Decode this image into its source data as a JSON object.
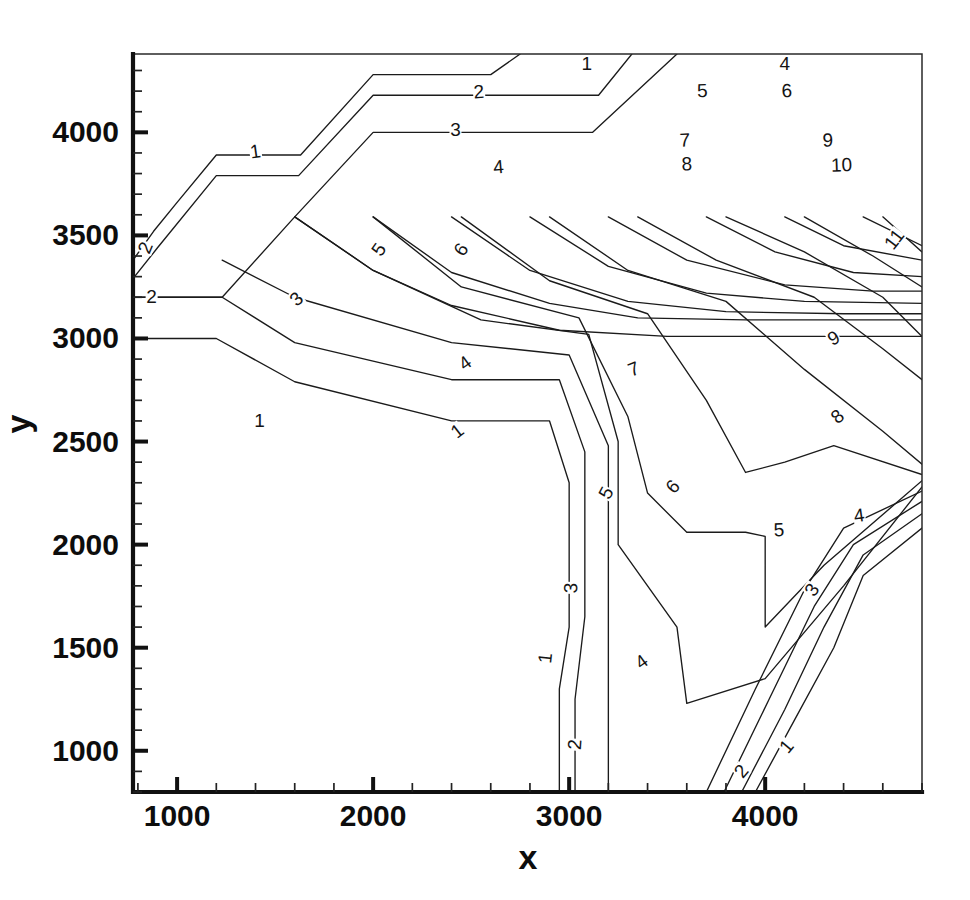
{
  "chart_data": {
    "type": "line",
    "title": "",
    "subtitle": "",
    "xlabel": "x",
    "ylabel": "y",
    "xlim": [
      775,
      4800
    ],
    "ylim": [
      800,
      4380
    ],
    "grid": false,
    "legend": "none",
    "plot_style": "contour",
    "contour_interval": 1,
    "contour_levels": [
      1,
      2,
      3,
      4,
      5,
      6,
      7,
      8,
      9,
      10,
      11
    ],
    "x_ticks_major": [
      1000,
      2000,
      3000,
      4000
    ],
    "x_ticks_major_labels": [
      "1000",
      "2000",
      "3000",
      "4000"
    ],
    "x_minor_per_major": 5,
    "y_ticks_major": [
      1000,
      1500,
      2000,
      2500,
      3000,
      3500,
      4000
    ],
    "y_ticks_major_labels": [
      "1000",
      "1500",
      "2000",
      "2500",
      "3000",
      "3500",
      "4000"
    ],
    "y_minor_per_major": 5,
    "line_color": "#1b1b1b",
    "axis_color": "#111111",
    "background_color": "#ffffff",
    "contours": [
      {
        "level": 1,
        "label": "1",
        "points": [
          [
            775,
            3380
          ],
          [
            880,
            3520
          ],
          [
            1000,
            3660
          ],
          [
            1200,
            3890
          ],
          [
            1630,
            3890
          ],
          [
            2000,
            4280
          ],
          [
            2600,
            4280
          ],
          [
            2750,
            4380
          ]
        ]
      },
      {
        "level": 2,
        "label": "2",
        "points": [
          [
            775,
            3290
          ],
          [
            900,
            3440
          ],
          [
            1200,
            3790
          ],
          [
            1620,
            3790
          ],
          [
            2000,
            4180
          ],
          [
            3150,
            4180
          ],
          [
            3320,
            4380
          ]
        ]
      },
      {
        "level": 3,
        "label": "3",
        "points": [
          [
            775,
            3200
          ],
          [
            1230,
            3200
          ],
          [
            1600,
            3590
          ],
          [
            2000,
            4000
          ],
          [
            3120,
            4000
          ],
          [
            3550,
            4380
          ]
        ]
      },
      {
        "level": 4,
        "label": "4",
        "points": [
          [
            1600,
            3590
          ],
          [
            2000,
            3330
          ],
          [
            2400,
            3160
          ],
          [
            2950,
            3040
          ],
          [
            3500,
            3010
          ],
          [
            3800,
            3010
          ],
          [
            4300,
            3010
          ],
          [
            4800,
            3010
          ]
        ]
      },
      {
        "level": 5,
        "label": "5",
        "points": [
          [
            2000,
            3590
          ],
          [
            2400,
            3320
          ],
          [
            2900,
            3170
          ],
          [
            3350,
            3100
          ],
          [
            3900,
            3090
          ],
          [
            4800,
            3090
          ]
        ]
      },
      {
        "level": 6,
        "label": "6",
        "points": [
          [
            2400,
            3590
          ],
          [
            2800,
            3330
          ],
          [
            3300,
            3180
          ],
          [
            3800,
            3130
          ],
          [
            4400,
            3120
          ],
          [
            4800,
            3120
          ]
        ]
      },
      {
        "level": 7,
        "label": "7",
        "points": [
          [
            2800,
            3590
          ],
          [
            3200,
            3350
          ],
          [
            3700,
            3220
          ],
          [
            4200,
            3180
          ],
          [
            4800,
            3170
          ]
        ]
      },
      {
        "level": 8,
        "label": "8",
        "points": [
          [
            3200,
            3590
          ],
          [
            3600,
            3380
          ],
          [
            4100,
            3260
          ],
          [
            4550,
            3230
          ],
          [
            4800,
            3230
          ]
        ]
      },
      {
        "level": 9,
        "label": "9",
        "points": [
          [
            3700,
            3590
          ],
          [
            4050,
            3420
          ],
          [
            4450,
            3320
          ],
          [
            4800,
            3300
          ]
        ]
      },
      {
        "level": 10,
        "label": "10",
        "points": [
          [
            4100,
            3590
          ],
          [
            4400,
            3450
          ],
          [
            4800,
            3380
          ]
        ]
      },
      {
        "level": 11,
        "label": "11",
        "points": [
          [
            4500,
            3590
          ],
          [
            4800,
            3450
          ]
        ]
      },
      {
        "level": 1,
        "label": "1",
        "points": [
          [
            775,
            3000
          ],
          [
            1200,
            3000
          ],
          [
            1600,
            2790
          ],
          [
            2400,
            2600
          ],
          [
            2900,
            2600
          ],
          [
            3000,
            2300
          ],
          [
            3000,
            1600
          ],
          [
            2950,
            1300
          ],
          [
            2950,
            800
          ]
        ]
      },
      {
        "level": 2,
        "label": "2",
        "points": [
          [
            775,
            3200
          ],
          [
            1230,
            3200
          ],
          [
            1600,
            2980
          ],
          [
            2400,
            2800
          ],
          [
            2950,
            2800
          ],
          [
            3080,
            2450
          ],
          [
            3080,
            1650
          ],
          [
            3030,
            1250
          ],
          [
            3030,
            800
          ]
        ]
      },
      {
        "level": 3,
        "label": "3",
        "points": [
          [
            1230,
            3380
          ],
          [
            1600,
            3200
          ],
          [
            2400,
            2980
          ],
          [
            3000,
            2920
          ],
          [
            3200,
            2480
          ],
          [
            3200,
            1700
          ],
          [
            3200,
            800
          ]
        ]
      },
      {
        "level": 4,
        "label": "4",
        "points": [
          [
            1600,
            3590
          ],
          [
            2000,
            3330
          ],
          [
            2550,
            3090
          ],
          [
            3100,
            3020
          ],
          [
            3250,
            2500
          ],
          [
            3250,
            2000
          ],
          [
            3550,
            1600
          ],
          [
            3600,
            1230
          ],
          [
            4000,
            1350
          ],
          [
            4400,
            1800
          ],
          [
            4800,
            2280
          ]
        ]
      },
      {
        "level": 5,
        "label": "5",
        "points": [
          [
            2000,
            3590
          ],
          [
            2450,
            3250
          ],
          [
            3050,
            3100
          ],
          [
            3300,
            2620
          ],
          [
            3400,
            2250
          ],
          [
            3600,
            2060
          ],
          [
            3900,
            2060
          ],
          [
            4000,
            2040
          ],
          [
            4000,
            1600
          ],
          [
            4300,
            1900
          ],
          [
            4800,
            2310
          ]
        ]
      },
      {
        "level": 6,
        "label": "6",
        "points": [
          [
            2450,
            3590
          ],
          [
            2900,
            3280
          ],
          [
            3400,
            3120
          ],
          [
            3700,
            2700
          ],
          [
            3900,
            2350
          ],
          [
            4100,
            2400
          ],
          [
            4350,
            2480
          ],
          [
            4800,
            2340
          ]
        ]
      },
      {
        "level": 7,
        "label": "7",
        "points": [
          [
            2900,
            3590
          ],
          [
            3300,
            3330
          ],
          [
            3800,
            3180
          ],
          [
            4200,
            2850
          ],
          [
            4600,
            2550
          ],
          [
            4800,
            2390
          ]
        ]
      },
      {
        "level": 8,
        "label": "8",
        "points": [
          [
            3350,
            3590
          ],
          [
            3750,
            3380
          ],
          [
            4250,
            3200
          ],
          [
            4600,
            2950
          ],
          [
            4800,
            2800
          ]
        ]
      },
      {
        "level": 9,
        "label": "9",
        "points": [
          [
            3800,
            3590
          ],
          [
            4200,
            3420
          ],
          [
            4600,
            3200
          ],
          [
            4800,
            3010
          ]
        ]
      },
      {
        "level": 10,
        "label": "10",
        "points": [
          [
            4200,
            3590
          ],
          [
            4550,
            3400
          ],
          [
            4800,
            3250
          ]
        ]
      },
      {
        "level": 11,
        "label": "11",
        "points": [
          [
            4600,
            3590
          ],
          [
            4800,
            3420
          ]
        ]
      },
      {
        "level": 1,
        "label": "1",
        "points": [
          [
            4800,
            2080
          ],
          [
            4500,
            1850
          ],
          [
            4350,
            1500
          ],
          [
            4150,
            1150
          ],
          [
            3950,
            800
          ]
        ]
      },
      {
        "level": 2,
        "label": "2",
        "points": [
          [
            4800,
            2150
          ],
          [
            4500,
            1950
          ],
          [
            4300,
            1600
          ],
          [
            4100,
            1200
          ],
          [
            3880,
            800
          ]
        ]
      },
      {
        "level": 3,
        "label": "3",
        "points": [
          [
            4800,
            2210
          ],
          [
            4450,
            2000
          ],
          [
            4250,
            1700
          ],
          [
            4020,
            1250
          ],
          [
            3790,
            800
          ]
        ]
      },
      {
        "level": 4,
        "label": "4",
        "points": [
          [
            4800,
            2260
          ],
          [
            4400,
            2080
          ],
          [
            4200,
            1780
          ],
          [
            3950,
            1300
          ],
          [
            3700,
            800
          ]
        ]
      }
    ],
    "contour_label_positions": [
      {
        "label": "1",
        "x": 1400,
        "y": 3905,
        "rotation": -8
      },
      {
        "label": "2",
        "x": 840,
        "y": 3440,
        "rotation": -68
      },
      {
        "label": "3",
        "x": 2420,
        "y": 4010,
        "rotation": 0
      },
      {
        "label": "4",
        "x": 2640,
        "y": 3830,
        "rotation": -5
      },
      {
        "label": "1",
        "x": 3090,
        "y": 4330,
        "rotation": 0
      },
      {
        "label": "2",
        "x": 2540,
        "y": 4195,
        "rotation": -4
      },
      {
        "label": "4",
        "x": 4100,
        "y": 4330,
        "rotation": 0
      },
      {
        "label": "5",
        "x": 3680,
        "y": 4200,
        "rotation": -2
      },
      {
        "label": "6",
        "x": 4110,
        "y": 4200,
        "rotation": -2
      },
      {
        "label": "7",
        "x": 3590,
        "y": 3960,
        "rotation": -2
      },
      {
        "label": "8",
        "x": 3600,
        "y": 3845,
        "rotation": -2
      },
      {
        "label": "9",
        "x": 4320,
        "y": 3960,
        "rotation": -2
      },
      {
        "label": "10",
        "x": 4390,
        "y": 3840,
        "rotation": -2
      },
      {
        "label": "11",
        "x": 4660,
        "y": 3480,
        "rotation": -52
      },
      {
        "label": "5",
        "x": 2030,
        "y": 3430,
        "rotation": -55
      },
      {
        "label": "6",
        "x": 2450,
        "y": 3430,
        "rotation": -55
      },
      {
        "label": "2",
        "x": 870,
        "y": 3200,
        "rotation": 0
      },
      {
        "label": "3",
        "x": 1610,
        "y": 3190,
        "rotation": -42
      },
      {
        "label": "1",
        "x": 1420,
        "y": 2600,
        "rotation": 0
      },
      {
        "label": "1",
        "x": 2430,
        "y": 2550,
        "rotation": -38
      },
      {
        "label": "4",
        "x": 2470,
        "y": 2880,
        "rotation": -36
      },
      {
        "label": "7",
        "x": 3330,
        "y": 2850,
        "rotation": -22
      },
      {
        "label": "9",
        "x": 4350,
        "y": 3000,
        "rotation": -30
      },
      {
        "label": "8",
        "x": 4370,
        "y": 2620,
        "rotation": -40
      },
      {
        "label": "5",
        "x": 3190,
        "y": 2250,
        "rotation": -62
      },
      {
        "label": "6",
        "x": 3530,
        "y": 2280,
        "rotation": -48
      },
      {
        "label": "5",
        "x": 4070,
        "y": 2070,
        "rotation": -3
      },
      {
        "label": "4",
        "x": 4480,
        "y": 2140,
        "rotation": -8
      },
      {
        "label": "3",
        "x": 3010,
        "y": 1790,
        "rotation": -88
      },
      {
        "label": "3",
        "x": 4240,
        "y": 1780,
        "rotation": -56
      },
      {
        "label": "1",
        "x": 2880,
        "y": 1450,
        "rotation": -84
      },
      {
        "label": "4",
        "x": 3370,
        "y": 1430,
        "rotation": -36
      },
      {
        "label": "2",
        "x": 3030,
        "y": 1030,
        "rotation": -86
      },
      {
        "label": "1",
        "x": 4110,
        "y": 1020,
        "rotation": -50
      },
      {
        "label": "2",
        "x": 3880,
        "y": 900,
        "rotation": -50
      }
    ]
  },
  "axes": {
    "x_title": "x",
    "y_title": "y"
  }
}
